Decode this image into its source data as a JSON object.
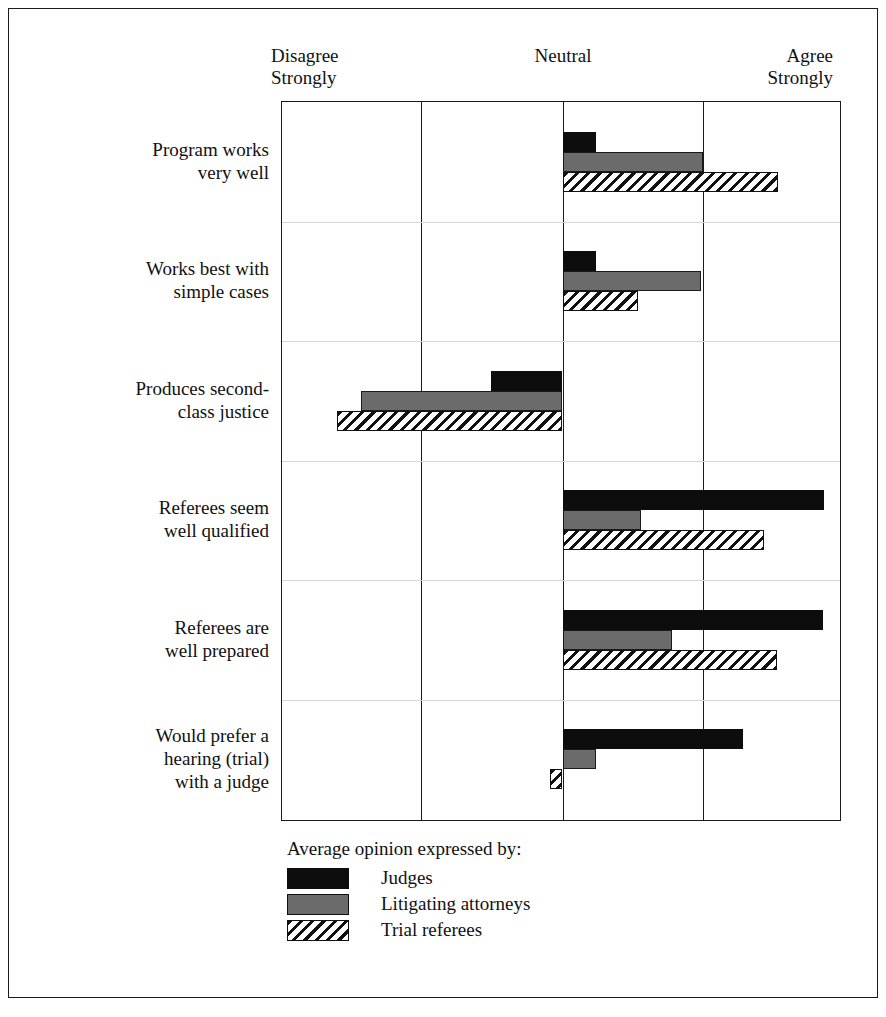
{
  "axis": {
    "left_label": "Disagree\nStrongly",
    "center_label": "Neutral",
    "right_label": "Agree\nStrongly"
  },
  "legend": {
    "title": "Average opinion expressed by:",
    "entries": [
      {
        "label": "Judges",
        "swatch": "solid-black"
      },
      {
        "label": "Litigating attorneys",
        "swatch": "solid-gray"
      },
      {
        "label": "Trial referees",
        "swatch": "diagonal-hatch"
      }
    ]
  },
  "categories": [
    "Program works\nvery well",
    "Works best with\nsimple cases",
    "Produces second-\nclass justice",
    "Referees seem\nwell qualified",
    "Referees are\nwell prepared",
    "Would prefer a\nhearing (trial)\nwith a judge"
  ],
  "chart_data": {
    "type": "bar",
    "orientation": "horizontal",
    "title": "",
    "xlabel": "",
    "ylabel": "",
    "xlim": [
      -2,
      2
    ],
    "xtick_labels": [
      "Disagree Strongly",
      "",
      "Neutral",
      "",
      "Agree Strongly"
    ],
    "xticks": [
      -2,
      -1,
      0,
      1,
      2
    ],
    "grid": "vertical",
    "legend_position": "below",
    "categories": [
      "Program works very well",
      "Works best with simple cases",
      "Produces second-class justice",
      "Referees seem well qualified",
      "Referees are well prepared",
      "Would prefer a hearing (trial) with a judge"
    ],
    "series": [
      {
        "name": "Judges",
        "color": "#0d0d0d",
        "values": [
          0.24,
          0.24,
          -0.51,
          1.87,
          1.86,
          1.29
        ]
      },
      {
        "name": "Litigating attorneys",
        "color": "#6b6b6b",
        "values": [
          1.0,
          0.99,
          -1.44,
          0.56,
          0.78,
          0.24
        ]
      },
      {
        "name": "Trial referees",
        "color": "#ffffff",
        "values": [
          1.54,
          0.54,
          -1.61,
          1.44,
          1.53,
          -0.09
        ]
      }
    ]
  }
}
